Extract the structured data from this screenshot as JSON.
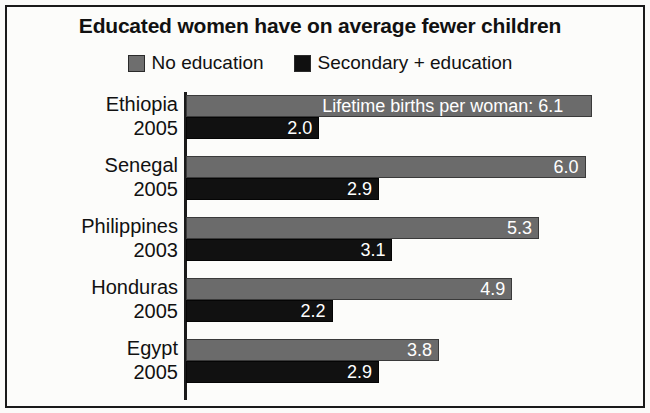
{
  "chart_data": {
    "type": "bar",
    "orientation": "horizontal",
    "title": "Educated women have on average fewer children",
    "xlabel": "",
    "ylabel": "",
    "xlim": [
      0,
      6.5
    ],
    "grid": false,
    "legend_position": "top-center",
    "annotation": "Lifetime births per woman: 6.1",
    "categories": [
      "Ethiopia 2005",
      "Senegal 2005",
      "Philippines 2003",
      "Honduras 2005",
      "Egypt 2005"
    ],
    "series": [
      {
        "name": "No education",
        "color": "#6b6b6b",
        "values": [
          6.1,
          6.0,
          5.3,
          4.9,
          3.8
        ]
      },
      {
        "name": "Secondary + education",
        "color": "#111111",
        "values": [
          2.0,
          2.9,
          3.1,
          2.2,
          2.9
        ]
      }
    ]
  },
  "legend": {
    "entries": [
      {
        "label": "No education",
        "swatch": "gray-swatch-icon"
      },
      {
        "label": "Secondary + education",
        "swatch": "black-swatch-icon"
      }
    ]
  },
  "rows": [
    {
      "country": "Ethiopia",
      "year": "2005",
      "no_education_value": "6.1",
      "no_education_number": 6.1,
      "secondary_value": "2.0",
      "secondary_number": 2.0,
      "annotation": "Lifetime births per woman: 6.1"
    },
    {
      "country": "Senegal",
      "year": "2005",
      "no_education_value": "6.0",
      "no_education_number": 6.0,
      "secondary_value": "2.9",
      "secondary_number": 2.9,
      "annotation": ""
    },
    {
      "country": "Philippines",
      "year": "2003",
      "no_education_value": "5.3",
      "no_education_number": 5.3,
      "secondary_value": "3.1",
      "secondary_number": 3.1,
      "annotation": ""
    },
    {
      "country": "Honduras",
      "year": "2005",
      "no_education_value": "4.9",
      "no_education_number": 4.9,
      "secondary_value": "2.2",
      "secondary_number": 2.2,
      "annotation": ""
    },
    {
      "country": "Egypt",
      "year": "2005",
      "no_education_value": "3.8",
      "no_education_number": 3.8,
      "secondary_value": "2.9",
      "secondary_number": 2.9,
      "annotation": ""
    }
  ],
  "layout": {
    "px_per_unit": 66.6,
    "group_height": 61,
    "group_top_start": 4
  },
  "colors": {
    "no_education": "#6b6b6b",
    "secondary_education": "#111111",
    "background": "#fcfcfa",
    "border": "#1a1a1a",
    "text": "#111111",
    "value_text": "#ffffff"
  }
}
